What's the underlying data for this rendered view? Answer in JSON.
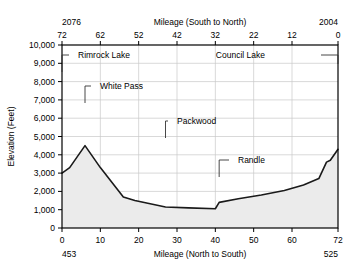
{
  "chart_data": {
    "type": "area",
    "title": "",
    "xlabel": "Mileage (North to South)",
    "ylabel": "Elevation (Feet)",
    "x": [
      0,
      2,
      6,
      10,
      16,
      19,
      27,
      33,
      40,
      41,
      46,
      52,
      58,
      63,
      67,
      69,
      70,
      72
    ],
    "values": [
      3000,
      3300,
      4500,
      3300,
      1700,
      1500,
      1150,
      1100,
      1050,
      1400,
      1600,
      1800,
      2050,
      2350,
      2700,
      3600,
      3700,
      4300
    ],
    "xlim": [
      0,
      72
    ],
    "ylim": [
      0,
      10000
    ],
    "grid": true,
    "legend": "none",
    "series": [
      {
        "name": "Elevation profile",
        "values": [
          3000,
          3300,
          4500,
          3300,
          1700,
          1500,
          1150,
          1100,
          1050,
          1400,
          1600,
          1800,
          2050,
          2350,
          2700,
          3600,
          3700,
          4300
        ]
      }
    ],
    "fill_color": "#ebebeb",
    "line_color": "#1a1a1a",
    "grid_color": "#c8c8c8",
    "axis_color": "#000000",
    "bottom_axis": {
      "label": "Mileage (North to South)",
      "ticks": [
        "0",
        "10",
        "20",
        "30",
        "40",
        "50",
        "60",
        "72"
      ],
      "tick_values": [
        0,
        10,
        20,
        30,
        40,
        50,
        60,
        72
      ],
      "milepost_left": "453",
      "milepost_right": "525"
    },
    "top_axis": {
      "label": "Mileage (South to North)",
      "ticks": [
        "72",
        "62",
        "52",
        "42",
        "32",
        "22",
        "12",
        "0"
      ],
      "tick_values": [
        0,
        10,
        20,
        30,
        40,
        50,
        60,
        72
      ],
      "milepost_left": "2076",
      "milepost_right": "2004"
    },
    "y_axis": {
      "label": "Elevation (Feet)",
      "ticks": [
        "0",
        "1,000",
        "2,000",
        "3,000",
        "4,000",
        "5,000",
        "6,000",
        "7,000",
        "8,000",
        "9,000",
        "10,000"
      ],
      "tick_values": [
        0,
        1000,
        2000,
        3000,
        4000,
        5000,
        6000,
        7000,
        8000,
        9000,
        10000
      ]
    },
    "annotations": [
      {
        "label": "Rimrock Lake",
        "x": 0,
        "text_x": 78,
        "text_y": 58,
        "leader": "left-elbow"
      },
      {
        "label": "White Pass",
        "x": 6,
        "text_x": 100,
        "text_y": 89,
        "leader": "left-elbow"
      },
      {
        "label": "Packwood",
        "x": 27,
        "text_x": 177,
        "text_y": 124,
        "leader": "left-elbow"
      },
      {
        "label": "Randle",
        "x": 41,
        "text_x": 238,
        "text_y": 163,
        "leader": "left-elbow"
      },
      {
        "label": "Council Lake",
        "x": 72,
        "text_x": 265,
        "text_y": 58,
        "leader": "right-elbow"
      }
    ]
  }
}
